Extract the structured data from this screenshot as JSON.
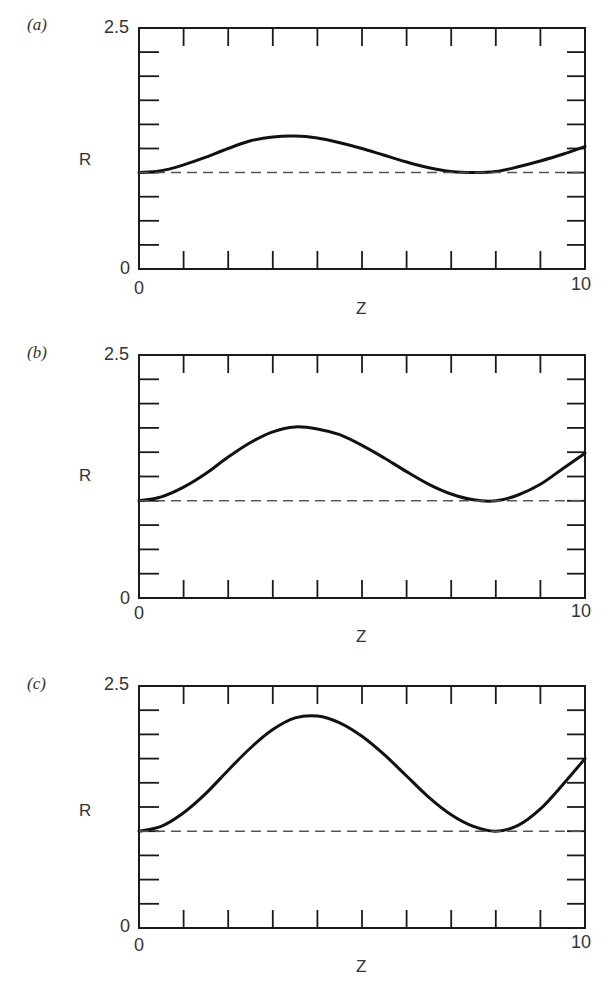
{
  "figure": {
    "panels": [
      {
        "label": "(a)",
        "y_top_tick": "2.5",
        "y_bottom_tick": "0",
        "x_left_tick": "0",
        "x_right_tick": "10",
        "ylabel": "R",
        "xlabel": "Z"
      },
      {
        "label": "(b)",
        "y_top_tick": "2.5",
        "y_bottom_tick": "0",
        "x_left_tick": "0",
        "x_right_tick": "10",
        "ylabel": "R",
        "xlabel": "Z"
      },
      {
        "label": "(c)",
        "y_top_tick": "2.5",
        "y_bottom_tick": "0",
        "x_left_tick": "0",
        "x_right_tick": "10",
        "ylabel": "R",
        "xlabel": "Z"
      }
    ],
    "colors": {
      "curve": "#111111",
      "frame": "#1a1a1a",
      "reference": "#555555",
      "background": "#ffffff"
    }
  },
  "chart_data": [
    {
      "type": "line",
      "title": "(a)",
      "xlabel": "Z",
      "ylabel": "R",
      "xlim": [
        0,
        10
      ],
      "ylim": [
        0,
        2.5
      ],
      "x_ticks_count": 11,
      "y_ticks_count": 11,
      "grid": false,
      "x": [
        0,
        0.5,
        1,
        1.5,
        2,
        2.5,
        3,
        3.5,
        4,
        4.5,
        5,
        5.5,
        6,
        6.5,
        7,
        7.5,
        8,
        8.5,
        9,
        9.5,
        10
      ],
      "series": [
        {
          "name": "R(Z)",
          "style": "solid",
          "values": [
            1.0,
            1.02,
            1.08,
            1.16,
            1.25,
            1.33,
            1.37,
            1.38,
            1.36,
            1.31,
            1.25,
            1.18,
            1.11,
            1.05,
            1.01,
            1.0,
            1.01,
            1.06,
            1.12,
            1.19,
            1.27
          ]
        },
        {
          "name": "reference R=1",
          "style": "dashed",
          "values": [
            1,
            1,
            1,
            1,
            1,
            1,
            1,
            1,
            1,
            1,
            1,
            1,
            1,
            1,
            1,
            1,
            1,
            1,
            1,
            1,
            1
          ]
        }
      ]
    },
    {
      "type": "line",
      "title": "(b)",
      "xlabel": "Z",
      "ylabel": "R",
      "xlim": [
        0,
        10
      ],
      "ylim": [
        0,
        2.5
      ],
      "x_ticks_count": 11,
      "y_ticks_count": 11,
      "grid": false,
      "x": [
        0,
        0.5,
        1,
        1.5,
        2,
        2.5,
        3,
        3.5,
        4,
        4.5,
        5,
        5.5,
        6,
        6.5,
        7,
        7.5,
        8,
        8.5,
        9,
        9.5,
        10
      ],
      "series": [
        {
          "name": "R(Z)",
          "style": "solid",
          "values": [
            1.0,
            1.04,
            1.14,
            1.28,
            1.45,
            1.6,
            1.71,
            1.76,
            1.74,
            1.68,
            1.57,
            1.44,
            1.3,
            1.17,
            1.07,
            1.01,
            1.0,
            1.06,
            1.17,
            1.33,
            1.49
          ]
        },
        {
          "name": "reference R=1",
          "style": "dashed",
          "values": [
            1,
            1,
            1,
            1,
            1,
            1,
            1,
            1,
            1,
            1,
            1,
            1,
            1,
            1,
            1,
            1,
            1,
            1,
            1,
            1,
            1
          ]
        }
      ]
    },
    {
      "type": "line",
      "title": "(c)",
      "xlabel": "Z",
      "ylabel": "R",
      "xlim": [
        0,
        10
      ],
      "ylim": [
        0,
        2.5
      ],
      "x_ticks_count": 11,
      "y_ticks_count": 11,
      "grid": false,
      "x": [
        0,
        0.5,
        1,
        1.5,
        2,
        2.5,
        3,
        3.5,
        4,
        4.5,
        5,
        5.5,
        6,
        6.5,
        7,
        7.5,
        8,
        8.5,
        9,
        9.5,
        10
      ],
      "series": [
        {
          "name": "R(Z)",
          "style": "solid",
          "values": [
            1.0,
            1.05,
            1.19,
            1.39,
            1.63,
            1.86,
            2.05,
            2.17,
            2.19,
            2.12,
            1.98,
            1.79,
            1.57,
            1.35,
            1.17,
            1.05,
            1.0,
            1.06,
            1.23,
            1.48,
            1.75
          ]
        },
        {
          "name": "reference R=1",
          "style": "dashed",
          "values": [
            1,
            1,
            1,
            1,
            1,
            1,
            1,
            1,
            1,
            1,
            1,
            1,
            1,
            1,
            1,
            1,
            1,
            1,
            1,
            1,
            1
          ]
        }
      ]
    }
  ]
}
